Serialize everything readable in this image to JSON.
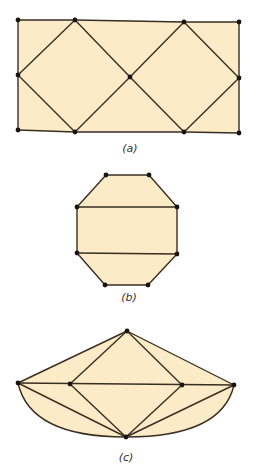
{
  "figure": {
    "style": {
      "fill_color": "#fcebc7",
      "edge_color": "#3a2e22",
      "vertex_color": "#1a1410",
      "background": "#ffffff"
    },
    "panels": [
      {
        "id": "a",
        "label": "(a)",
        "label_pos": [
          130,
          152
        ],
        "description": "Rectangle subdivided by two diamonds meeting at a central vertex",
        "outline": [
          [
            18,
            20
          ],
          [
            75,
            20
          ],
          [
            184,
            22
          ],
          [
            239,
            22
          ],
          [
            239,
            78
          ],
          [
            239,
            133
          ],
          [
            184,
            132
          ],
          [
            75,
            132
          ],
          [
            18,
            130
          ],
          [
            18,
            75
          ]
        ],
        "vertices": [
          [
            18,
            20
          ],
          [
            75,
            20
          ],
          [
            184,
            22
          ],
          [
            239,
            22
          ],
          [
            18,
            75
          ],
          [
            130,
            77
          ],
          [
            239,
            78
          ],
          [
            18,
            130
          ],
          [
            75,
            132
          ],
          [
            184,
            132
          ],
          [
            239,
            133
          ]
        ],
        "edges": [
          [
            [
              18,
              20
            ],
            [
              75,
              20
            ]
          ],
          [
            [
              75,
              20
            ],
            [
              184,
              22
            ]
          ],
          [
            [
              184,
              22
            ],
            [
              239,
              22
            ]
          ],
          [
            [
              239,
              22
            ],
            [
              239,
              78
            ]
          ],
          [
            [
              239,
              78
            ],
            [
              239,
              133
            ]
          ],
          [
            [
              239,
              133
            ],
            [
              184,
              132
            ]
          ],
          [
            [
              184,
              132
            ],
            [
              75,
              132
            ]
          ],
          [
            [
              75,
              132
            ],
            [
              18,
              130
            ]
          ],
          [
            [
              18,
              130
            ],
            [
              18,
              75
            ]
          ],
          [
            [
              18,
              75
            ],
            [
              18,
              20
            ]
          ],
          [
            [
              18,
              75
            ],
            [
              75,
              20
            ]
          ],
          [
            [
              75,
              20
            ],
            [
              130,
              77
            ]
          ],
          [
            [
              130,
              77
            ],
            [
              75,
              132
            ]
          ],
          [
            [
              75,
              132
            ],
            [
              18,
              75
            ]
          ],
          [
            [
              130,
              77
            ],
            [
              184,
              22
            ]
          ],
          [
            [
              184,
              22
            ],
            [
              239,
              78
            ]
          ],
          [
            [
              239,
              78
            ],
            [
              184,
              132
            ]
          ],
          [
            [
              184,
              132
            ],
            [
              130,
              77
            ]
          ]
        ]
      },
      {
        "id": "b",
        "label": "(b)",
        "label_pos": [
          129,
          301
        ],
        "description": "Octagon divided by two horizontal chords",
        "outline": [
          [
            106,
            175
          ],
          [
            149,
            175
          ],
          [
            177,
            207
          ],
          [
            177,
            254
          ],
          [
            148,
            285
          ],
          [
            105,
            285
          ],
          [
            77,
            253
          ],
          [
            77,
            207
          ]
        ],
        "vertices": [
          [
            106,
            175
          ],
          [
            149,
            175
          ],
          [
            77,
            207
          ],
          [
            177,
            207
          ],
          [
            77,
            253
          ],
          [
            177,
            254
          ],
          [
            105,
            285
          ],
          [
            148,
            285
          ]
        ],
        "edges": [
          [
            [
              106,
              175
            ],
            [
              149,
              175
            ]
          ],
          [
            [
              149,
              175
            ],
            [
              177,
              207
            ]
          ],
          [
            [
              177,
              207
            ],
            [
              177,
              254
            ]
          ],
          [
            [
              177,
              254
            ],
            [
              148,
              285
            ]
          ],
          [
            [
              148,
              285
            ],
            [
              105,
              285
            ]
          ],
          [
            [
              105,
              285
            ],
            [
              77,
              253
            ]
          ],
          [
            [
              77,
              253
            ],
            [
              77,
              207
            ]
          ],
          [
            [
              77,
              207
            ],
            [
              106,
              175
            ]
          ],
          [
            [
              77,
              207
            ],
            [
              177,
              207
            ]
          ],
          [
            [
              77,
              253
            ],
            [
              177,
              254
            ]
          ]
        ]
      },
      {
        "id": "c",
        "label": "(c)",
        "label_pos": [
          126,
          461
        ],
        "description": "Planar graph with a central diamond, outer triangle-like boundary and two curved lower edges",
        "vertices": [
          [
            127,
            331
          ],
          [
            18,
            383
          ],
          [
            70,
            384
          ],
          [
            182,
            385
          ],
          [
            234,
            385
          ],
          [
            126,
            437
          ]
        ],
        "edges": [
          [
            [
              127,
              331
            ],
            [
              18,
              383
            ]
          ],
          [
            [
              127,
              331
            ],
            [
              70,
              384
            ]
          ],
          [
            [
              127,
              331
            ],
            [
              182,
              385
            ]
          ],
          [
            [
              127,
              331
            ],
            [
              234,
              385
            ]
          ],
          [
            [
              18,
              383
            ],
            [
              234,
              385
            ]
          ],
          [
            [
              18,
              383
            ],
            [
              126,
              437
            ]
          ],
          [
            [
              70,
              384
            ],
            [
              126,
              437
            ]
          ],
          [
            [
              182,
              385
            ],
            [
              126,
              437
            ]
          ],
          [
            [
              234,
              385
            ],
            [
              126,
              437
            ]
          ]
        ],
        "curved_edges": [
          {
            "from": [
              18,
              383
            ],
            "to": [
              126,
              437
            ],
            "control": [
              30,
              437
            ]
          },
          {
            "from": [
              126,
              437
            ],
            "to": [
              234,
              385
            ],
            "control": [
              222,
              437
            ]
          }
        ]
      }
    ]
  }
}
